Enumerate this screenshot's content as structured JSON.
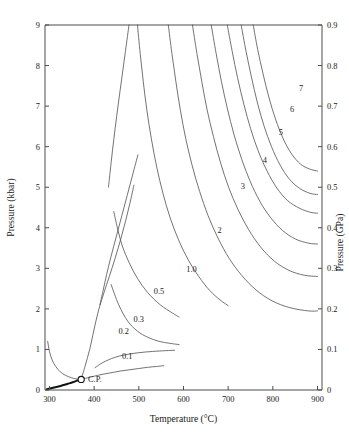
{
  "chart_data": {
    "type": "line",
    "title": "",
    "xlabel": "Temperature (°C)",
    "ylabel": "Pressure (kbar)",
    "ylabel_right": "Pressure (GPa)",
    "xlim": [
      290,
      910
    ],
    "ylim": [
      0,
      9
    ],
    "ylim_right": [
      0,
      0.9
    ],
    "grid": false,
    "legend_position": "inline-curve-labels",
    "xticks": [
      300,
      400,
      500,
      600,
      700,
      800,
      900
    ],
    "xticklabels": [
      "300",
      "400",
      "500",
      "600",
      "700",
      "800",
      "900"
    ],
    "yticks": [
      0,
      1,
      2,
      3,
      4,
      5,
      6,
      7,
      8,
      9
    ],
    "yticklabels": [
      "0",
      "1",
      "2",
      "3",
      "4",
      "5",
      "6",
      "7",
      "8",
      "9"
    ],
    "yticks_right": [
      0,
      0.1,
      0.2,
      0.3,
      0.4,
      0.5,
      0.6,
      0.7,
      0.8,
      0.9
    ],
    "yticklabels_right": [
      "0",
      "0.1",
      "0.2",
      "0.3",
      "0.4",
      "0.5",
      "0.6",
      "0.7",
      "0.8",
      "0.9"
    ],
    "annotations": [
      {
        "text": "C.P.",
        "x": 384,
        "y": 0.28,
        "marker": "open-circle",
        "marker_x": 371,
        "marker_y": 0.26
      }
    ],
    "series": [
      {
        "name": "0.1",
        "label": "0.1",
        "label_x": 474,
        "label_y": 0.8,
        "points": [
          [
            371,
            0.26
          ],
          [
            385,
            0.3
          ],
          [
            400,
            0.34
          ],
          [
            420,
            0.39
          ],
          [
            440,
            0.43
          ],
          [
            460,
            0.47
          ],
          [
            480,
            0.5
          ],
          [
            500,
            0.53
          ],
          [
            520,
            0.56
          ],
          [
            540,
            0.58
          ],
          [
            556,
            0.6
          ]
        ]
      },
      {
        "name": "0.2",
        "label": "0.2",
        "label_x": 466,
        "label_y": 1.44,
        "points": [
          [
            371,
            0.26
          ],
          [
            380,
            0.6
          ],
          [
            390,
            1.0
          ],
          [
            397,
            1.35
          ],
          [
            404,
            1.7
          ],
          [
            412,
            2.05
          ],
          [
            422,
            2.4
          ],
          [
            434,
            2.8
          ],
          [
            447,
            3.25
          ],
          [
            459,
            3.7
          ],
          [
            470,
            4.15
          ],
          [
            480,
            4.6
          ],
          [
            489,
            5.05
          ]
        ]
      },
      {
        "name": "0.2-lower",
        "label": "",
        "label_x": 0,
        "label_y": 0,
        "points": [
          [
            402,
            0.55
          ],
          [
            420,
            0.68
          ],
          [
            445,
            0.8
          ],
          [
            470,
            0.87
          ],
          [
            500,
            0.92
          ],
          [
            530,
            0.95
          ],
          [
            560,
            0.97
          ],
          [
            580,
            0.98
          ]
        ]
      },
      {
        "name": "0.3",
        "label": "0.3",
        "label_x": 500,
        "label_y": 1.73,
        "points": [
          [
            413,
            2.1
          ],
          [
            420,
            2.45
          ],
          [
            428,
            2.85
          ],
          [
            438,
            3.3
          ],
          [
            450,
            3.8
          ],
          [
            462,
            4.3
          ],
          [
            474,
            4.8
          ],
          [
            486,
            5.3
          ],
          [
            498,
            5.8
          ]
        ]
      },
      {
        "name": "0.3-lower",
        "label": "",
        "label_x": 0,
        "label_y": 0,
        "points": [
          [
            438,
            2.6
          ],
          [
            455,
            2.1
          ],
          [
            475,
            1.7
          ],
          [
            497,
            1.45
          ],
          [
            520,
            1.3
          ],
          [
            545,
            1.2
          ],
          [
            570,
            1.15
          ],
          [
            590,
            1.12
          ]
        ]
      },
      {
        "name": "0.5",
        "label": "0.5",
        "label_x": 545,
        "label_y": 2.42,
        "points": [
          [
            432,
            5.0
          ],
          [
            436,
            5.4
          ],
          [
            441,
            5.9
          ],
          [
            447,
            6.45
          ],
          [
            454,
            7.05
          ],
          [
            462,
            7.7
          ],
          [
            470,
            8.35
          ],
          [
            478,
            9.0
          ]
        ]
      },
      {
        "name": "0.5-branch",
        "label": "",
        "label_x": 0,
        "label_y": 0,
        "points": [
          [
            444,
            4.4
          ],
          [
            452,
            4.0
          ],
          [
            463,
            3.55
          ],
          [
            478,
            3.15
          ],
          [
            497,
            2.75
          ],
          [
            520,
            2.4
          ],
          [
            548,
            2.1
          ],
          [
            575,
            1.9
          ],
          [
            590,
            1.8
          ]
        ]
      },
      {
        "name": "1.0",
        "label": "1.0",
        "label_x": 618,
        "label_y": 2.95,
        "points": [
          [
            497,
            9.0
          ],
          [
            503,
            8.3
          ],
          [
            510,
            7.6
          ],
          [
            518,
            6.9
          ],
          [
            528,
            6.2
          ],
          [
            540,
            5.5
          ],
          [
            554,
            4.85
          ],
          [
            570,
            4.25
          ],
          [
            589,
            3.7
          ],
          [
            610,
            3.22
          ],
          [
            634,
            2.8
          ],
          [
            659,
            2.45
          ],
          [
            682,
            2.22
          ],
          [
            700,
            2.08
          ]
        ]
      },
      {
        "name": "2",
        "label": "2",
        "label_x": 681,
        "label_y": 3.92,
        "points": [
          [
            566,
            9.0
          ],
          [
            574,
            8.3
          ],
          [
            583,
            7.6
          ],
          [
            593,
            6.9
          ],
          [
            605,
            6.2
          ],
          [
            619,
            5.55
          ],
          [
            636,
            4.9
          ],
          [
            655,
            4.3
          ],
          [
            677,
            3.75
          ],
          [
            702,
            3.25
          ],
          [
            730,
            2.83
          ],
          [
            762,
            2.47
          ],
          [
            798,
            2.2
          ],
          [
            838,
            2.03
          ],
          [
            880,
            1.95
          ],
          [
            900,
            1.95
          ]
        ]
      },
      {
        "name": "3",
        "label": "3",
        "label_x": 733,
        "label_y": 5.0,
        "points": [
          [
            620,
            9.0
          ],
          [
            630,
            8.3
          ],
          [
            641,
            7.6
          ],
          [
            653,
            6.9
          ],
          [
            667,
            6.25
          ],
          [
            683,
            5.6
          ],
          [
            701,
            5.0
          ],
          [
            722,
            4.45
          ],
          [
            746,
            3.95
          ],
          [
            773,
            3.52
          ],
          [
            803,
            3.18
          ],
          [
            836,
            2.95
          ],
          [
            870,
            2.83
          ],
          [
            900,
            2.8
          ]
        ]
      },
      {
        "name": "4",
        "label": "4",
        "label_x": 782,
        "label_y": 5.64,
        "points": [
          [
            662,
            9.0
          ],
          [
            673,
            8.3
          ],
          [
            685,
            7.6
          ],
          [
            698,
            6.95
          ],
          [
            713,
            6.3
          ],
          [
            730,
            5.7
          ],
          [
            749,
            5.15
          ],
          [
            771,
            4.65
          ],
          [
            795,
            4.25
          ],
          [
            822,
            3.93
          ],
          [
            851,
            3.72
          ],
          [
            880,
            3.62
          ],
          [
            900,
            3.6
          ]
        ]
      },
      {
        "name": "5",
        "label": "5",
        "label_x": 818,
        "label_y": 6.33,
        "points": [
          [
            698,
            9.0
          ],
          [
            709,
            8.35
          ],
          [
            721,
            7.7
          ],
          [
            735,
            7.05
          ],
          [
            750,
            6.45
          ],
          [
            767,
            5.9
          ],
          [
            787,
            5.4
          ],
          [
            809,
            4.98
          ],
          [
            833,
            4.67
          ],
          [
            860,
            4.48
          ],
          [
            885,
            4.38
          ],
          [
            900,
            4.36
          ]
        ]
      },
      {
        "name": "6",
        "label": "6",
        "label_x": 843,
        "label_y": 6.9,
        "points": [
          [
            729,
            9.0
          ],
          [
            740,
            8.35
          ],
          [
            752,
            7.72
          ],
          [
            765,
            7.1
          ],
          [
            780,
            6.52
          ],
          [
            797,
            6.0
          ],
          [
            816,
            5.55
          ],
          [
            837,
            5.2
          ],
          [
            860,
            4.97
          ],
          [
            883,
            4.85
          ],
          [
            900,
            4.82
          ]
        ]
      },
      {
        "name": "7",
        "label": "7",
        "label_x": 863,
        "label_y": 7.42,
        "points": [
          [
            756,
            9.0
          ],
          [
            766,
            8.4
          ],
          [
            778,
            7.8
          ],
          [
            791,
            7.22
          ],
          [
            806,
            6.68
          ],
          [
            823,
            6.2
          ],
          [
            842,
            5.82
          ],
          [
            862,
            5.57
          ],
          [
            882,
            5.45
          ],
          [
            900,
            5.4
          ]
        ]
      },
      {
        "name": "liquid-vapor-boiling-curve",
        "label": "",
        "label_x": 0,
        "label_y": 0,
        "style": "thick",
        "points": [
          [
            294,
            0.02
          ],
          [
            310,
            0.06
          ],
          [
            325,
            0.1
          ],
          [
            340,
            0.15
          ],
          [
            352,
            0.19
          ],
          [
            362,
            0.23
          ],
          [
            371,
            0.26
          ]
        ]
      },
      {
        "name": "left-edge-isochore",
        "label": "",
        "label_x": 0,
        "label_y": 0,
        "points": [
          [
            296,
            1.2
          ],
          [
            300,
            0.95
          ],
          [
            306,
            0.74
          ],
          [
            314,
            0.58
          ],
          [
            324,
            0.45
          ],
          [
            336,
            0.36
          ],
          [
            350,
            0.3
          ],
          [
            362,
            0.27
          ],
          [
            371,
            0.26
          ]
        ]
      }
    ]
  }
}
